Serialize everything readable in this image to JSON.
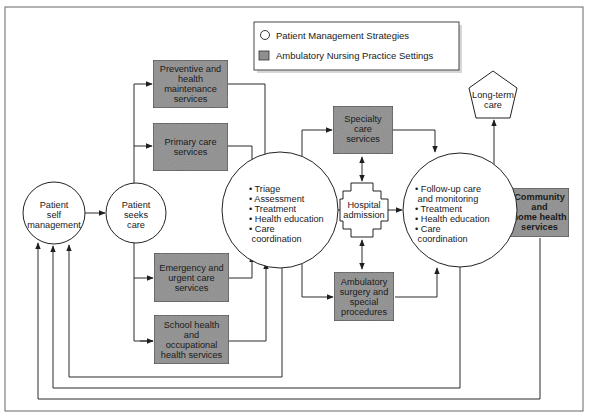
{
  "legend": {
    "items": [
      {
        "shape": "circle",
        "label": "Patient Management Strategies"
      },
      {
        "shape": "gray-box",
        "label": "Ambulatory Nursing Practice Settings"
      }
    ]
  },
  "colors": {
    "setting_fill": "#8f8f8f",
    "strategy_fill": "#ffffff",
    "line": "#2a2a2a",
    "frame": "#555555"
  },
  "nodes": {
    "self_management": {
      "type": "strategy",
      "lines": [
        "Patient",
        "self",
        "management"
      ]
    },
    "seeks_care": {
      "type": "strategy",
      "lines": [
        "Patient",
        "seeks",
        "care"
      ]
    },
    "preventive": {
      "type": "setting",
      "lines": [
        "Preventive and",
        "health",
        "maintenance",
        "services"
      ]
    },
    "primary": {
      "type": "setting",
      "lines": [
        "Primary care",
        "services"
      ]
    },
    "emergency": {
      "type": "setting",
      "lines": [
        "Emergency and",
        "urgent care",
        "services"
      ]
    },
    "school": {
      "type": "setting",
      "lines": [
        "School health",
        "and",
        "occupational",
        "health services"
      ]
    },
    "triage": {
      "type": "strategy",
      "lines": [
        "• Triage",
        "• Assessment",
        "• Treatment",
        "• Health education",
        "• Care",
        "  coordination"
      ]
    },
    "specialty": {
      "type": "setting",
      "lines": [
        "Specialty",
        "care",
        "services"
      ]
    },
    "hospital": {
      "type": "cross",
      "lines": [
        "Hospital",
        "admission"
      ]
    },
    "ambulatory": {
      "type": "setting",
      "lines": [
        "Ambulatory",
        "surgery and",
        "special",
        "procedures"
      ]
    },
    "followup": {
      "type": "strategy",
      "lines": [
        "• Follow-up care",
        "  and monitoring",
        "• Treatment",
        "• Health education",
        "• Care",
        "  coordination"
      ]
    },
    "longterm": {
      "type": "pentagon",
      "lines": [
        "Long-term",
        "care"
      ]
    },
    "community": {
      "type": "setting",
      "lines": [
        "Community",
        "and",
        "home health",
        "services"
      ]
    }
  }
}
